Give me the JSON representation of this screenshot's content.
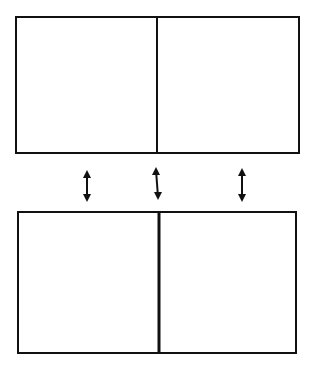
{
  "diagram": {
    "stroke_color": "#111111",
    "background": "#ffffff",
    "top_box": {
      "x": 16,
      "y": 17,
      "width": 283,
      "height": 136,
      "divider_x": 157,
      "cells": [
        {
          "label": ""
        },
        {
          "label": ""
        }
      ]
    },
    "bottom_box": {
      "x": 18,
      "y": 212,
      "width": 278,
      "height": 141,
      "divider_x": 159,
      "cells": [
        {
          "label": ""
        },
        {
          "label": ""
        }
      ]
    },
    "arrows": [
      {
        "name": "left",
        "x": 87,
        "y1": 170,
        "y2": 202,
        "type": "double-headed"
      },
      {
        "name": "center",
        "x": 157,
        "y1": 167,
        "y2": 200,
        "type": "double-headed"
      },
      {
        "name": "right",
        "x": 242,
        "y1": 168,
        "y2": 202,
        "type": "double-headed"
      }
    ]
  }
}
